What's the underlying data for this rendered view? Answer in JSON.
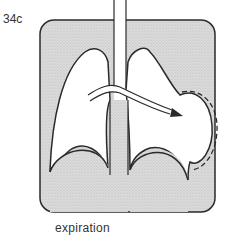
{
  "figure": {
    "label": "34c",
    "caption": "expiration",
    "colors": {
      "background": "#ffffff",
      "thorax_fill": "#d9d9d9",
      "outline": "#2a2a2a"
    },
    "parts": [
      "thorax",
      "trachea",
      "left-lung",
      "right-lung",
      "diaphragm",
      "airflow-arrow",
      "mediastinal-shift-dashed-line"
    ]
  }
}
